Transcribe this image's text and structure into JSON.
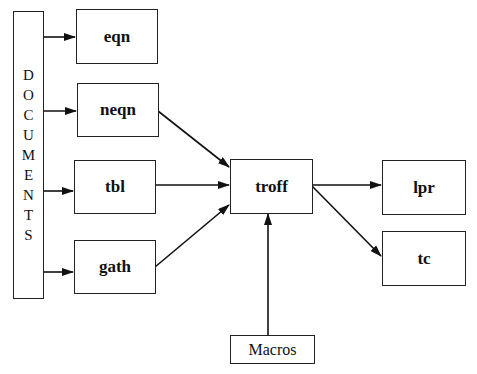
{
  "diagram": {
    "source": {
      "label": "DOCUMENTS",
      "letters": [
        "D",
        "O",
        "C",
        "U",
        "M",
        "E",
        "N",
        "T",
        "S"
      ]
    },
    "preprocessors": [
      {
        "id": "eqn",
        "label": "eqn"
      },
      {
        "id": "neqn",
        "label": "neqn"
      },
      {
        "id": "tbl",
        "label": "tbl"
      },
      {
        "id": "gath",
        "label": "gath"
      }
    ],
    "formatter": {
      "id": "troff",
      "label": "troff"
    },
    "macros": {
      "id": "macros",
      "label": "Macros"
    },
    "outputs": [
      {
        "id": "lpr",
        "label": "lpr"
      },
      {
        "id": "tc",
        "label": "tc"
      }
    ],
    "edges": [
      {
        "from": "DOCUMENTS",
        "to": "eqn"
      },
      {
        "from": "DOCUMENTS",
        "to": "neqn"
      },
      {
        "from": "DOCUMENTS",
        "to": "tbl"
      },
      {
        "from": "DOCUMENTS",
        "to": "gath"
      },
      {
        "from": "neqn",
        "to": "troff"
      },
      {
        "from": "tbl",
        "to": "troff"
      },
      {
        "from": "gath",
        "to": "troff"
      },
      {
        "from": "Macros",
        "to": "troff"
      },
      {
        "from": "troff",
        "to": "lpr"
      },
      {
        "from": "troff",
        "to": "tc"
      }
    ]
  }
}
